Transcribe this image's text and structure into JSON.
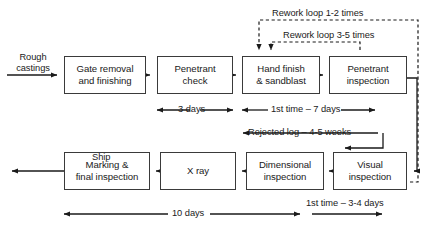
{
  "diagram": {
    "colors": {
      "box_border": "#3a3a3a",
      "line": "#1a1a1a",
      "dashed_line": "#1a1a1a",
      "background": "#ffffff",
      "text": "#1a1a1a"
    },
    "input_label": "Rough\ncastings",
    "output_label": "Ship",
    "boxes": [
      {
        "id": "gate-removal",
        "label": "Gate removal\nand finishing",
        "row": "top",
        "x": 64,
        "y": 56,
        "w": 82,
        "h": 38
      },
      {
        "id": "penetrant-check",
        "label": "Penetrant\ncheck",
        "row": "top",
        "x": 157,
        "y": 56,
        "w": 76,
        "h": 38
      },
      {
        "id": "hand-finish",
        "label": "Hand finish\n& sandblast",
        "row": "top",
        "x": 242,
        "y": 56,
        "w": 78,
        "h": 38
      },
      {
        "id": "penetrant-inspection",
        "label": "Penetrant\ninspection",
        "row": "top",
        "x": 329,
        "y": 56,
        "w": 78,
        "h": 38
      },
      {
        "id": "marking-final",
        "label": "Marking &\nfinal inspection",
        "row": "bottom",
        "x": 64,
        "y": 152,
        "w": 86,
        "h": 38
      },
      {
        "id": "x-ray",
        "label": "X ray",
        "row": "bottom",
        "x": 160,
        "y": 152,
        "w": 76,
        "h": 38
      },
      {
        "id": "dimensional",
        "label": "Dimensional\ninspection",
        "row": "bottom",
        "x": 246,
        "y": 152,
        "w": 78,
        "h": 38
      },
      {
        "id": "visual-inspection",
        "label": "Visual\ninspection",
        "row": "bottom",
        "x": 333,
        "y": 152,
        "w": 74,
        "h": 38
      }
    ],
    "annotations": {
      "rework_loop_1_2": "Rework loop 1-2 times",
      "rework_loop_3_5": "Rework loop 3-5 times",
      "three_days": "3 days",
      "first_time_7_days": "1st time – 7 days",
      "rejected_log": "Rejected log – 4-5 weeks",
      "ten_days": "10 days",
      "first_time_3_4_days": "1st time – 3-4 days"
    }
  }
}
